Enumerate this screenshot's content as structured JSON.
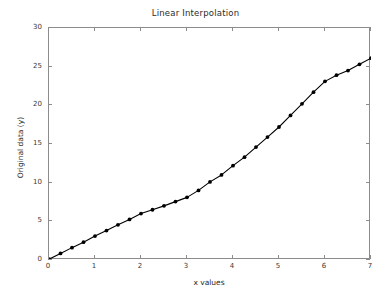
{
  "chart_data": {
    "type": "line",
    "title": "Linear Interpolation",
    "xlabel": "x values",
    "ylabel": "Original data (y)",
    "xlim": [
      0,
      7
    ],
    "ylim": [
      0,
      30
    ],
    "xticks": [
      0,
      1,
      2,
      3,
      4,
      5,
      6,
      7
    ],
    "yticks": [
      0,
      5,
      10,
      15,
      20,
      25,
      30
    ],
    "grid": false,
    "legend": null,
    "marker": "circle",
    "line_color": "#000000",
    "marker_color": "#000000",
    "series": [
      {
        "name": "Original data",
        "x": [
          0,
          0.25,
          0.5,
          0.75,
          1.0,
          1.25,
          1.5,
          1.75,
          2.0,
          2.25,
          2.5,
          2.75,
          3.0,
          3.25,
          3.5,
          3.75,
          4.0,
          4.25,
          4.5,
          4.75,
          5.0,
          5.25,
          5.5,
          5.75,
          6.0,
          6.25,
          6.5,
          6.75,
          7.0
        ],
        "values": [
          0.1,
          0.85,
          1.6,
          2.3,
          3.1,
          3.8,
          4.55,
          5.25,
          6.0,
          6.5,
          7.0,
          7.55,
          8.1,
          9.0,
          10.1,
          11.0,
          12.2,
          13.3,
          14.6,
          15.9,
          17.2,
          18.7,
          20.2,
          21.7,
          23.1,
          23.9,
          24.5,
          25.3,
          26.1
        ]
      }
    ]
  },
  "figure": {
    "background_color": "#ffffff",
    "axes_color": "#8c8c8c",
    "text_color": "#2b2b2b"
  }
}
